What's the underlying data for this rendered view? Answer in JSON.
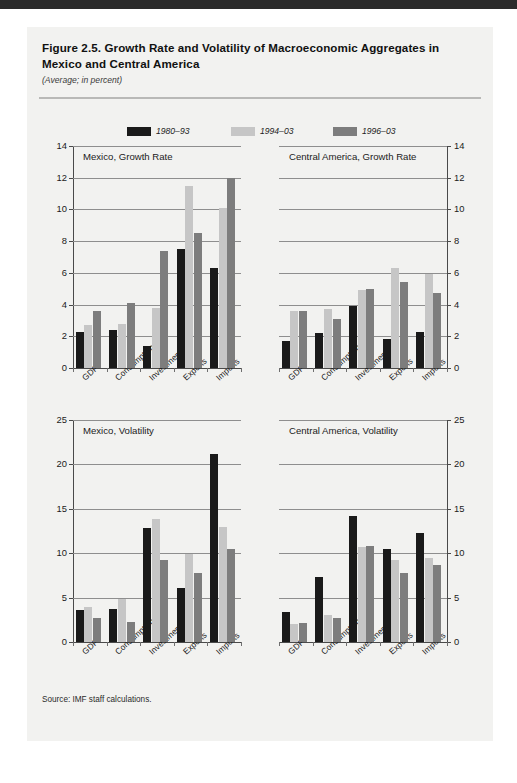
{
  "figure": {
    "title": "Figure 2.5.  Growth Rate and Volatility of Macroeconomic Aggregates in Mexico and Central America",
    "subtitle": "(Average; in percent)",
    "source": "Source: IMF staff calculations."
  },
  "legend": {
    "items": [
      {
        "label": "1980–93",
        "color": "#1a1a1a"
      },
      {
        "label": "1994–03",
        "color": "#c6c6c6"
      },
      {
        "label": "1996–03",
        "color": "#7d7d7d"
      }
    ]
  },
  "colors": {
    "series_1980_93": "#1a1a1a",
    "series_1994_03": "#c6c6c6",
    "series_1996_03": "#7d7d7d",
    "card_background": "#f2f2f0",
    "gridline": "#8e8e8e",
    "axis": "#4a4a4a",
    "text": "#1b1b1b"
  },
  "chart_data": [
    {
      "type": "bar",
      "title": "Mexico, Growth Rate",
      "xlabel": "",
      "ylabel": "",
      "ylim": [
        0,
        14
      ],
      "yticks": [
        0,
        2,
        4,
        6,
        8,
        10,
        12,
        14
      ],
      "grid": true,
      "legend_position": "top",
      "categories": [
        "GDP",
        "Consumption",
        "Investment",
        "Exports",
        "Imports"
      ],
      "series": [
        {
          "name": "1980–93",
          "values": [
            2.25,
            2.4,
            1.4,
            7.5,
            6.3
          ]
        },
        {
          "name": "1994–03",
          "values": [
            2.7,
            2.8,
            3.8,
            11.5,
            10.1
          ]
        },
        {
          "name": "1996–03",
          "values": [
            3.6,
            4.1,
            7.4,
            8.5,
            12.0
          ]
        }
      ]
    },
    {
      "type": "bar",
      "title": "Central America, Growth Rate",
      "xlabel": "",
      "ylabel": "",
      "ylim": [
        0,
        14
      ],
      "yticks": [
        0,
        2,
        4,
        6,
        8,
        10,
        12,
        14
      ],
      "grid": true,
      "legend_position": "top",
      "categories": [
        "GDP",
        "Consumption",
        "Investment",
        "Exports",
        "Imports"
      ],
      "series": [
        {
          "name": "1980–93",
          "values": [
            1.7,
            2.2,
            3.9,
            1.8,
            2.3
          ]
        },
        {
          "name": "1994–03",
          "values": [
            3.6,
            3.7,
            4.9,
            6.3,
            5.9
          ]
        },
        {
          "name": "1996–03",
          "values": [
            3.6,
            3.1,
            5.0,
            5.4,
            4.7
          ]
        }
      ]
    },
    {
      "type": "bar",
      "title": "Mexico, Volatility",
      "xlabel": "",
      "ylabel": "",
      "ylim": [
        0,
        25
      ],
      "yticks": [
        0,
        5,
        10,
        15,
        20,
        25
      ],
      "grid": true,
      "legend_position": "none",
      "categories": [
        "GDP",
        "Consumption",
        "Investment",
        "Exports",
        "Imports"
      ],
      "series": [
        {
          "name": "1980–93",
          "values": [
            3.6,
            3.7,
            12.8,
            6.1,
            21.2
          ]
        },
        {
          "name": "1994–03",
          "values": [
            3.9,
            4.8,
            13.9,
            9.9,
            13.0
          ]
        },
        {
          "name": "1996–03",
          "values": [
            2.7,
            2.3,
            9.2,
            7.8,
            10.5
          ]
        }
      ]
    },
    {
      "type": "bar",
      "title": "Central America, Volatility",
      "xlabel": "",
      "ylabel": "",
      "ylim": [
        0,
        25
      ],
      "yticks": [
        0,
        5,
        10,
        15,
        20,
        25
      ],
      "grid": true,
      "legend_position": "none",
      "categories": [
        "GDP",
        "Consumption",
        "Investment",
        "Exports",
        "Imports"
      ],
      "series": [
        {
          "name": "1980–93",
          "values": [
            3.4,
            7.3,
            14.2,
            10.5,
            12.3
          ]
        },
        {
          "name": "1994–03",
          "values": [
            2.0,
            3.0,
            10.7,
            9.2,
            9.5
          ]
        },
        {
          "name": "1996–03",
          "values": [
            2.1,
            2.7,
            10.8,
            7.8,
            8.7
          ]
        }
      ]
    }
  ]
}
